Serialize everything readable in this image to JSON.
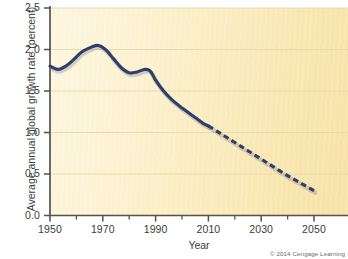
{
  "chart_data": {
    "type": "line",
    "title": "",
    "xlabel": "Year",
    "ylabel": "Average annual global growth rate (percent)",
    "xlim": [
      1950,
      2050
    ],
    "ylim": [
      0.0,
      2.5
    ],
    "grid": true,
    "grid_orientation": "horizontal",
    "legend": "none",
    "xticks": [
      1950,
      1970,
      1990,
      2010,
      2030,
      2050
    ],
    "xtick_labels": [
      "1950",
      "1970",
      "1990",
      "2010",
      "2030",
      "2050"
    ],
    "xminor_ticks": [
      1960,
      1980,
      2000,
      2020,
      2040
    ],
    "yticks": [
      0.0,
      0.5,
      1.0,
      1.5,
      2.0,
      2.5
    ],
    "ytick_labels": [
      "0.0",
      "0.5",
      "1.0",
      "1.5",
      "2.0",
      "2.5"
    ],
    "line_color": "#2e3f68",
    "background_color": "#fbeec4",
    "series": [
      {
        "name": "Historical average annual global growth rate",
        "style": "solid",
        "x": [
          1950,
          1953,
          1956,
          1959,
          1962,
          1965,
          1968,
          1971,
          1974,
          1977,
          1980,
          1983,
          1986,
          1988,
          1990,
          1993,
          1996,
          1999,
          2002,
          2005,
          2008,
          2010
        ],
        "values": [
          1.8,
          1.76,
          1.8,
          1.88,
          1.97,
          2.02,
          2.05,
          2.0,
          1.89,
          1.78,
          1.72,
          1.73,
          1.76,
          1.74,
          1.63,
          1.5,
          1.4,
          1.32,
          1.25,
          1.18,
          1.11,
          1.08
        ]
      },
      {
        "name": "Projected average annual global growth rate",
        "style": "dashed",
        "x": [
          2010,
          2015,
          2020,
          2025,
          2030,
          2035,
          2040,
          2045,
          2050
        ],
        "values": [
          1.08,
          0.98,
          0.88,
          0.78,
          0.68,
          0.58,
          0.48,
          0.39,
          0.3
        ]
      }
    ],
    "annotations": [
      {
        "text": "Solid line is historical data through 2010; dashed line is projection to 2050"
      }
    ]
  },
  "figure": {
    "copyright": "© 2014 Cengage Learning"
  }
}
